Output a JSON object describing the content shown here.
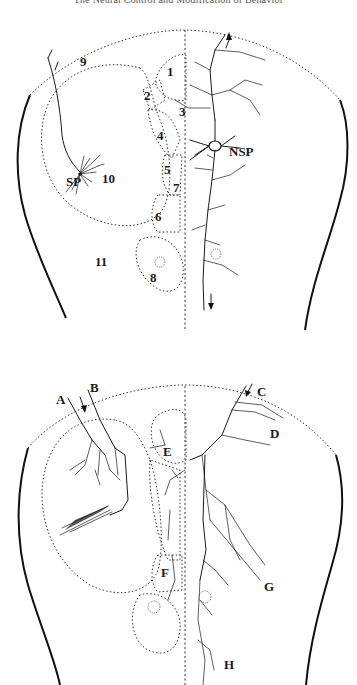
{
  "running_head": "The Neural Control and Modification of Behavior",
  "figure_top": {
    "region_labels": [
      "1",
      "2",
      "3",
      "4",
      "5",
      "6",
      "7",
      "8",
      "9",
      "10",
      "11"
    ],
    "neuron_labels": {
      "sp": "SP",
      "nsp": "NSP"
    },
    "arrows": {
      "top_axon": "up",
      "descending": "down"
    }
  },
  "figure_bottom": {
    "fiber_labels": [
      "A",
      "B",
      "C",
      "D",
      "E",
      "F",
      "G",
      "H"
    ],
    "arrows": {
      "ab_entry": "down",
      "c_entry": "down"
    }
  }
}
